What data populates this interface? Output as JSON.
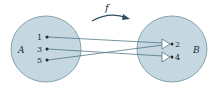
{
  "diagram": {
    "function_label": "f",
    "domain": {
      "name": "A",
      "elements": [
        "1",
        "3",
        "5"
      ]
    },
    "codomain": {
      "name": "B",
      "elements": [
        "2",
        "4"
      ]
    },
    "mappings": [
      {
        "from": "1",
        "to": "2"
      },
      {
        "from": "3",
        "to": "4"
      },
      {
        "from": "5",
        "to": "2"
      }
    ],
    "colors": {
      "set_fill": "#c5d8e2",
      "set_stroke": "#5b7d8c",
      "line": "#3f6575",
      "arrow_fill": "#2d4f5f"
    }
  }
}
